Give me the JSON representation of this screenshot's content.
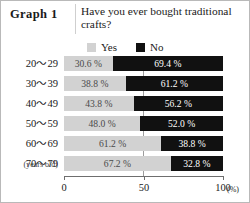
{
  "header": {
    "graph_label": "Graph 1",
    "question": "Have you ever bought traditional crafts?"
  },
  "legend": {
    "items": [
      {
        "label": "Yes",
        "color": "#d2d2d2",
        "swatch": "yes-swatch"
      },
      {
        "label": "No",
        "color": "#111111",
        "swatch": "no-swatch"
      }
    ]
  },
  "axis": {
    "ticks": [
      "0",
      "50",
      "100"
    ],
    "unit": "(%)",
    "category_note": "(years old)"
  },
  "chart_data": {
    "type": "bar",
    "orientation": "horizontal",
    "stacked": true,
    "title": "Have you ever bought traditional crafts?",
    "xlabel": "(%)",
    "ylabel": "(years old)",
    "xlim": [
      0,
      100
    ],
    "xticks": [
      0,
      50,
      100
    ],
    "grid": true,
    "legend_position": "top",
    "categories": [
      "20～29",
      "30～39",
      "40～49",
      "50～59",
      "60～69",
      "70～79"
    ],
    "series": [
      {
        "name": "Yes",
        "color": "#d2d2d2",
        "values": [
          30.6,
          38.8,
          43.8,
          48.0,
          61.2,
          67.2
        ]
      },
      {
        "name": "No",
        "color": "#111111",
        "values": [
          69.4,
          61.2,
          56.2,
          52.0,
          38.8,
          32.8
        ]
      }
    ],
    "labels": [
      {
        "category": "20～29",
        "yes": "30.6 %",
        "no": "69.4 %"
      },
      {
        "category": "30～39",
        "yes": "38.8 %",
        "no": "61.2 %"
      },
      {
        "category": "40～49",
        "yes": "43.8 %",
        "no": "56.2 %"
      },
      {
        "category": "50～59",
        "yes": "48.0 %",
        "no": "52.0 %"
      },
      {
        "category": "60～69",
        "yes": "61.2 %",
        "no": "38.8 %"
      },
      {
        "category": "70～79",
        "yes": "67.2 %",
        "no": "32.8 %"
      }
    ]
  }
}
